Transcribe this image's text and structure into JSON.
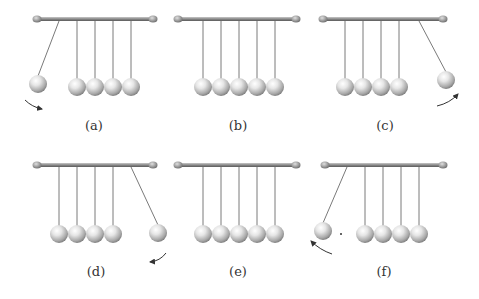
{
  "figure": {
    "colors": {
      "bar": "#8a8a8a",
      "string": "#7a7a7a",
      "arrow": "#333333",
      "label": "#333333",
      "ball_highlight": "#ffffff",
      "ball_shadow": "#7d7d7d"
    },
    "panels": [
      {
        "id": "a",
        "label": "(a)",
        "bar_x1": 37,
        "bar_x2": 153,
        "bar_y": 19,
        "label_x": 94,
        "label_y": 118,
        "pivots": [
          59,
          77,
          95,
          113,
          131
        ],
        "rest_y": 87,
        "ball_r": 9,
        "swing": {
          "index": 0,
          "ball_x": 38,
          "ball_y": 84
        },
        "arrow": {
          "path": "M25,100 Q32,107 42,109",
          "head": [
            42,
            109
          ]
        }
      },
      {
        "id": "b",
        "label": "(b)",
        "bar_x1": 178,
        "bar_x2": 296,
        "bar_y": 19,
        "label_x": 238,
        "label_y": 118,
        "pivots": [
          203,
          221,
          239,
          257,
          275
        ],
        "rest_y": 87,
        "ball_r": 9,
        "swing": null,
        "arrow": null
      },
      {
        "id": "c",
        "label": "(c)",
        "bar_x1": 323,
        "bar_x2": 443,
        "bar_y": 19,
        "label_x": 385,
        "label_y": 118,
        "pivots": [
          345,
          363,
          381,
          399,
          419
        ],
        "rest_y": 87,
        "ball_r": 9,
        "swing": {
          "index": 4,
          "ball_x": 446,
          "ball_y": 80
        },
        "arrow": {
          "path": "M437,106 Q450,103 458,94",
          "head": [
            458,
            94
          ]
        }
      },
      {
        "id": "d",
        "label": "(d)",
        "bar_x1": 37,
        "bar_x2": 153,
        "bar_y": 165,
        "label_x": 96,
        "label_y": 264,
        "pivots": [
          59,
          77,
          95,
          113,
          131
        ],
        "rest_y": 234,
        "ball_r": 9,
        "swing": {
          "index": 4,
          "ball_x": 158,
          "ball_y": 233
        },
        "arrow": {
          "path": "M166,253 Q160,261 150,262",
          "head": [
            150,
            262
          ]
        }
      },
      {
        "id": "e",
        "label": "(e)",
        "bar_x1": 178,
        "bar_x2": 296,
        "bar_y": 165,
        "label_x": 238,
        "label_y": 264,
        "pivots": [
          203,
          221,
          239,
          257,
          275
        ],
        "rest_y": 234,
        "ball_r": 9,
        "swing": null,
        "arrow": null
      },
      {
        "id": "f",
        "label": "(f)",
        "bar_x1": 325,
        "bar_x2": 443,
        "bar_y": 165,
        "label_x": 384,
        "label_y": 264,
        "pivots": [
          347,
          365,
          383,
          401,
          419
        ],
        "rest_y": 234,
        "ball_r": 9,
        "swing": {
          "index": 0,
          "ball_x": 323,
          "ball_y": 231
        },
        "arrow": {
          "path": "M332,254 Q320,250 311,241",
          "head": [
            311,
            241
          ]
        },
        "dot": [
          341,
          234
        ]
      }
    ]
  }
}
